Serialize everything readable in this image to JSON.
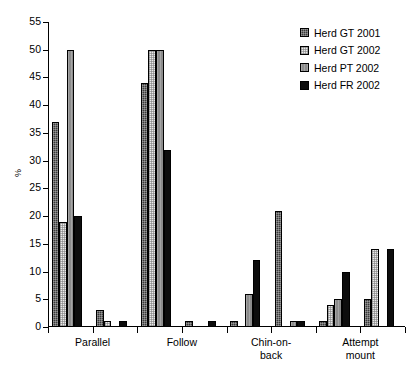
{
  "chart_data": {
    "type": "bar",
    "title": "",
    "subtitle": "",
    "xlabel": "",
    "ylabel": "%",
    "ylim": [
      0,
      55
    ],
    "yticks": [
      0,
      5,
      10,
      15,
      20,
      25,
      30,
      35,
      40,
      45,
      50,
      55
    ],
    "grid": false,
    "legend_position": "top-right",
    "categories": [
      "Parallel",
      "Follow",
      "Chin-on-back",
      "Attempt mount"
    ],
    "series": [
      {
        "name": "Herd GT 2001",
        "color": "#3a3a3a",
        "pattern": "dense-dotted",
        "values": [
          37,
          44,
          1,
          5
        ]
      },
      {
        "name": "Herd GT 2002",
        "color": "#eaeaea",
        "pattern": "light-dotted",
        "values": [
          19,
          50,
          12,
          14
        ]
      },
      {
        "name": "Herd PT 2002",
        "color": "#8c8c8c",
        "pattern": "vertical-hatch",
        "values": [
          50,
          50,
          6,
          14
        ]
      },
      {
        "name": "Herd FR 2002",
        "color": "#0d0d0d",
        "pattern": "solid",
        "values": [
          20,
          32,
          21,
          10
        ]
      }
    ],
    "groups": [
      {
        "label": "Parallel",
        "bars": [
          {
            "series": "Herd GT 2001",
            "value": 37
          },
          {
            "series": "Herd GT 2002",
            "value": 19
          },
          {
            "series": "Herd PT 2002",
            "value": 50
          },
          {
            "series": "Herd FR 2002",
            "value": 20
          }
        ]
      },
      {
        "label": "",
        "bars": [
          {
            "series": "Herd GT 2001",
            "value": 3
          },
          {
            "series": "Herd GT 2002",
            "value": 1
          },
          {
            "series": "Herd PT 2002",
            "value": 0
          },
          {
            "series": "Herd FR 2002",
            "value": 1
          }
        ]
      },
      {
        "label": "Follow",
        "bars": [
          {
            "series": "Herd GT 2001",
            "value": 44
          },
          {
            "series": "Herd GT 2002",
            "value": 50
          },
          {
            "series": "Herd PT 2002",
            "value": 50
          },
          {
            "series": "Herd FR 2002",
            "value": 32
          }
        ]
      },
      {
        "label": "",
        "bars": [
          {
            "series": "Herd GT 2001",
            "value": 1
          },
          {
            "series": "Herd GT 2002",
            "value": 0
          },
          {
            "series": "Herd PT 2002",
            "value": 0
          },
          {
            "series": "Herd FR 2002",
            "value": 1
          }
        ]
      },
      {
        "label": "Chin-on-back",
        "bars": [
          {
            "series": "Herd GT 2001",
            "value": 1
          },
          {
            "series": "Herd GT 2002",
            "value": 0
          },
          {
            "series": "Herd PT 2002",
            "value": 6
          },
          {
            "series": "Herd FR 2002",
            "value": 12
          }
        ]
      },
      {
        "label": "",
        "bars": [
          {
            "series": "Herd GT 2001",
            "value": 21
          },
          {
            "series": "Herd GT 2002",
            "value": 0
          },
          {
            "series": "Herd PT 2002",
            "value": 1
          },
          {
            "series": "Herd FR 2002",
            "value": 1
          }
        ]
      },
      {
        "label": "Attempt mount",
        "bars": [
          {
            "series": "Herd GT 2001",
            "value": 1
          },
          {
            "series": "Herd GT 2002",
            "value": 4
          },
          {
            "series": "Herd PT 2002",
            "value": 5
          },
          {
            "series": "Herd FR 2002",
            "value": 10
          }
        ]
      },
      {
        "label": "",
        "bars": [
          {
            "series": "Herd GT 2001",
            "value": 5
          },
          {
            "series": "Herd GT 2002",
            "value": 14
          },
          {
            "series": "Herd PT 2002",
            "value": 0
          },
          {
            "series": "Herd FR 2002",
            "value": 14
          }
        ]
      }
    ]
  },
  "legend": {
    "items": [
      {
        "label": "Herd GT 2001"
      },
      {
        "label": "Herd GT 2002"
      },
      {
        "label": "Herd PT 2002"
      },
      {
        "label": "Herd FR 2002"
      }
    ]
  },
  "axis": {
    "y_title": "%",
    "y_tick_labels": [
      "0",
      "5",
      "10",
      "15",
      "20",
      "25",
      "30",
      "35",
      "40",
      "45",
      "50",
      "55"
    ],
    "x_tick_labels": [
      "Parallel",
      "Follow",
      "Chin-on-back",
      "Attempt mount"
    ]
  }
}
